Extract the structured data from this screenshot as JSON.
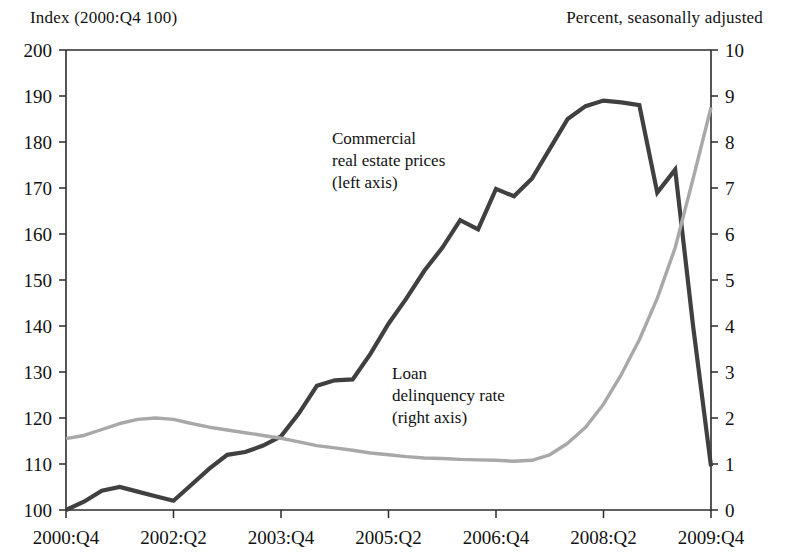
{
  "header": {
    "left": "Index (2000:Q4   100)",
    "right": "Percent, seasonally adjusted"
  },
  "annotations": {
    "cre": {
      "line1": "Commercial",
      "line2": "real estate prices",
      "line3": "(left axis)"
    },
    "delinquency": {
      "line1": "Loan",
      "line2": "delinquency rate",
      "line3": "(right axis)"
    }
  },
  "chart_data": {
    "type": "line",
    "title": "",
    "xlabel": "",
    "grid": false,
    "legend_position": "inline-annotations",
    "x_tick_labels": [
      "2000:Q4",
      "2002:Q2",
      "2003:Q4",
      "2005:Q2",
      "2006:Q4",
      "2008:Q2",
      "2009:Q4"
    ],
    "x_tick_indices": [
      0,
      6,
      12,
      18,
      24,
      30,
      36
    ],
    "x_quarters": [
      "2000:Q4",
      "2001:Q1",
      "2001:Q2",
      "2001:Q3",
      "2001:Q4",
      "2002:Q1",
      "2002:Q2",
      "2002:Q3",
      "2002:Q4",
      "2003:Q1",
      "2003:Q2",
      "2003:Q3",
      "2003:Q4",
      "2004:Q1",
      "2004:Q2",
      "2004:Q3",
      "2004:Q4",
      "2005:Q1",
      "2005:Q2",
      "2005:Q3",
      "2005:Q4",
      "2006:Q1",
      "2006:Q2",
      "2006:Q3",
      "2006:Q4",
      "2007:Q1",
      "2007:Q2",
      "2007:Q3",
      "2007:Q4",
      "2008:Q1",
      "2008:Q2",
      "2008:Q3",
      "2008:Q4",
      "2009:Q1",
      "2009:Q2",
      "2009:Q3",
      "2009:Q4"
    ],
    "left_axis": {
      "label": "Index (2000:Q4 = 100)",
      "ylim": [
        100,
        200
      ],
      "ticks": [
        100,
        110,
        120,
        130,
        140,
        150,
        160,
        170,
        180,
        190,
        200
      ]
    },
    "right_axis": {
      "label": "Percent, seasonally adjusted",
      "ylim": [
        0,
        10
      ],
      "ticks": [
        0,
        1,
        2,
        3,
        4,
        5,
        6,
        7,
        8,
        9,
        10
      ]
    },
    "series": [
      {
        "name": "Commercial real estate prices (left axis)",
        "axis": "left",
        "color": "#404040",
        "values": [
          100.0,
          101.8,
          104.2,
          105.0,
          104.0,
          103.0,
          102.0,
          105.5,
          109.0,
          112.0,
          112.6,
          114.0,
          116.0,
          121.0,
          127.0,
          128.2,
          128.4,
          134.0,
          140.5,
          146.0,
          152.0,
          157.0,
          163.0,
          161.0,
          169.8,
          168.2,
          172.0,
          178.5,
          185.0,
          187.8,
          189.0,
          188.6,
          188.0,
          169.0,
          174.0,
          140.0,
          109.5
        ]
      },
      {
        "name": "Loan delinquency rate (right axis)",
        "axis": "right",
        "color": "#a8a8a8",
        "values": [
          1.55,
          1.62,
          1.75,
          1.88,
          1.97,
          2.0,
          1.97,
          1.88,
          1.8,
          1.74,
          1.68,
          1.62,
          1.56,
          1.48,
          1.4,
          1.35,
          1.3,
          1.24,
          1.2,
          1.16,
          1.13,
          1.12,
          1.1,
          1.09,
          1.08,
          1.06,
          1.08,
          1.2,
          1.45,
          1.8,
          2.3,
          2.95,
          3.7,
          4.6,
          5.7,
          7.2,
          8.75
        ]
      }
    ]
  }
}
